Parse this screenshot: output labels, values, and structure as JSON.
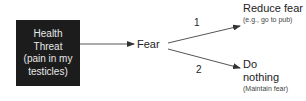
{
  "diagram": {
    "source_node": {
      "lines": [
        "Health",
        "Threat",
        "(pain in my",
        "testicles)"
      ],
      "background": "#1c1c1c",
      "text_color": "#e8e8e8"
    },
    "middle_node": {
      "label": "Fear"
    },
    "branches": [
      {
        "number": "1",
        "label": "Reduce fear",
        "sublabel": "(e.g., go to pub)"
      },
      {
        "number": "2",
        "label_lines": [
          "Do",
          "nothing"
        ],
        "sublabel": "(Maintain fear)"
      }
    ],
    "edges": [
      {
        "from": "Health Threat",
        "to": "Fear"
      },
      {
        "from": "Fear",
        "to": "Reduce fear",
        "label": "1"
      },
      {
        "from": "Fear",
        "to": "Do nothing",
        "label": "2"
      }
    ]
  }
}
